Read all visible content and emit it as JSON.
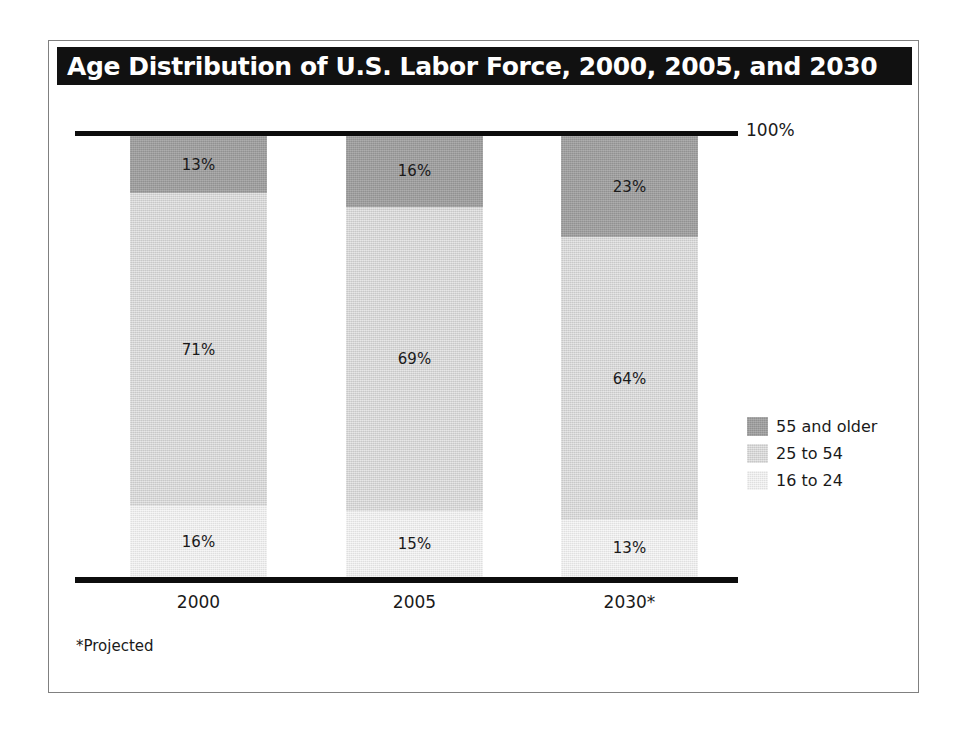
{
  "figure": {
    "title": "Age Distribution of U.S. Labor Force, 2000, 2005, and 2030",
    "footnote": "*Projected",
    "top_axis_label": "100%",
    "title_bg": "#111111",
    "title_color": "#ffffff",
    "frame_border_color": "#808080",
    "axis_color": "#0d0d0d"
  },
  "chart_data": {
    "type": "bar",
    "title": "Age Distribution of U.S. Labor Force, 2000, 2005, and 2030",
    "subtitle": "",
    "xlabel": "",
    "ylabel": "",
    "ylim": [
      0,
      100
    ],
    "stacked": true,
    "percent_total": 100,
    "grid": false,
    "legend_position": "right",
    "annotations": [
      "100%",
      "*Projected"
    ],
    "categories": [
      "2000",
      "2005",
      "2030*"
    ],
    "tick_labels": [
      "2000",
      "2005",
      "2030*"
    ],
    "series": [
      {
        "name": "55 and older",
        "color": "#9d9d9d",
        "values": [
          13,
          16,
          23
        ],
        "labels": [
          "13%",
          "16%",
          "23%"
        ]
      },
      {
        "name": "25 to 54",
        "color": "#d4d4d4",
        "values": [
          71,
          69,
          64
        ],
        "labels": [
          "71%",
          "69%",
          "64%"
        ]
      },
      {
        "name": "16 to 24",
        "color": "#e9e9e9",
        "values": [
          16,
          15,
          13
        ],
        "labels": [
          "16%",
          "15%",
          "13%"
        ]
      }
    ]
  },
  "legend": {
    "items": [
      {
        "label": "55 and older",
        "color": "#9d9d9d",
        "swatch": "legend-swatch-older"
      },
      {
        "label": "25 to 54",
        "color": "#d4d4d4",
        "swatch": "legend-swatch-mid"
      },
      {
        "label": "16 to 24",
        "color": "#e9e9e9",
        "swatch": "legend-swatch-young"
      }
    ]
  },
  "bars": [
    {
      "category": "2000",
      "segments": [
        {
          "series": "55 and older",
          "value": 13,
          "label": "13%"
        },
        {
          "series": "25 to 54",
          "value": 71,
          "label": "71%"
        },
        {
          "series": "16 to 24",
          "value": 16,
          "label": "16%"
        }
      ]
    },
    {
      "category": "2005",
      "segments": [
        {
          "series": "55 and older",
          "value": 16,
          "label": "16%"
        },
        {
          "series": "25 to 54",
          "value": 69,
          "label": "69%"
        },
        {
          "series": "16 to 24",
          "value": 15,
          "label": "15%"
        }
      ]
    },
    {
      "category": "2030*",
      "segments": [
        {
          "series": "55 and older",
          "value": 23,
          "label": "23%"
        },
        {
          "series": "25 to 54",
          "value": 64,
          "label": "64%"
        },
        {
          "series": "16 to 24",
          "value": 13,
          "label": "13%"
        }
      ]
    }
  ]
}
